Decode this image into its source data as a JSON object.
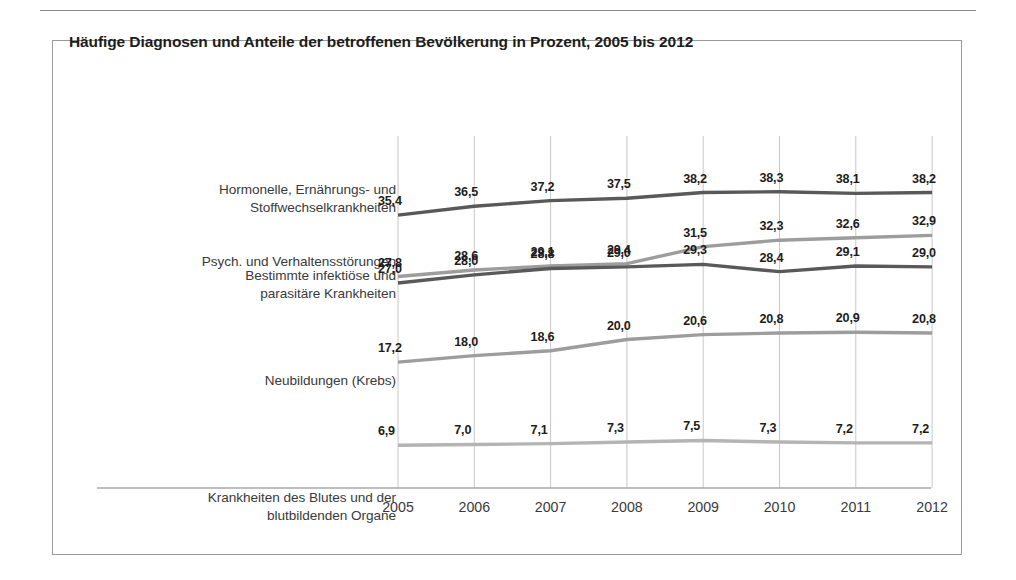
{
  "chart_data": {
    "type": "line",
    "title": "Häufige Diagnosen und Anteile der betroffenen Bevölkerung in Prozent, 2005 bis 2012",
    "xlabel": "",
    "ylabel": "",
    "categories": [
      "2005",
      "2006",
      "2007",
      "2008",
      "2009",
      "2010",
      "2011",
      "2012"
    ],
    "ylim": [
      0,
      40
    ],
    "grid": "vertical",
    "legend": "row-labels-left",
    "value_format": "german-decimal-comma",
    "series": [
      {
        "name": "Hormonelle, Ernährungs- und\nStoffwechselkrankheiten",
        "color": "#595959",
        "values": [
          35.4,
          36.5,
          37.2,
          37.5,
          38.2,
          38.3,
          38.1,
          38.2
        ],
        "labels": [
          "35,4",
          "36,5",
          "37,2",
          "37,5",
          "38,2",
          "38,3",
          "38,1",
          "38,2"
        ]
      },
      {
        "name": "Psych. und Verhaltensstörungen",
        "color": "#9d9d9d",
        "values": [
          27.8,
          28.6,
          29.1,
          29.4,
          31.5,
          32.3,
          32.6,
          32.9
        ],
        "labels": [
          "27,8",
          "28,6",
          "29,1",
          "29,4",
          "31,5",
          "32,3",
          "32,6",
          "32,9"
        ]
      },
      {
        "name": "Bestimmte infektiöse und\nparasitäre Krankheiten",
        "color": "#595959",
        "values": [
          27.0,
          28.0,
          28.8,
          29.0,
          29.3,
          28.4,
          29.1,
          29.0
        ],
        "labels": [
          "27,0",
          "28,0",
          "28,8",
          "29,0",
          "29,3",
          "28,4",
          "29,1",
          "29,0"
        ]
      },
      {
        "name": "Neubildungen (Krebs)",
        "color": "#9d9d9d",
        "values": [
          17.2,
          18.0,
          18.6,
          20.0,
          20.6,
          20.8,
          20.9,
          20.8
        ],
        "labels": [
          "17,2",
          "18,0",
          "18,6",
          "20,0",
          "20,6",
          "20,8",
          "20,9",
          "20,8"
        ]
      },
      {
        "name": "Krankheiten des Blutes und der\nblutbildenden Organe",
        "color": "#b4b4b4",
        "values": [
          6.9,
          7.0,
          7.1,
          7.3,
          7.5,
          7.3,
          7.2,
          7.2
        ],
        "labels": [
          "6,9",
          "7,0",
          "7,1",
          "7,3",
          "7,5",
          "7,3",
          "7,2",
          "7,2"
        ]
      }
    ]
  },
  "axis": {
    "years": [
      "2005",
      "2006",
      "2007",
      "2008",
      "2009",
      "2010",
      "2011",
      "2012"
    ]
  },
  "colors": {
    "dark_line": "#595959",
    "mid_line": "#9d9d9d",
    "light_line": "#b4b4b4",
    "grid": "#c8c8c8",
    "frame": "#9a9a9a",
    "text": "#3a3a3a"
  }
}
